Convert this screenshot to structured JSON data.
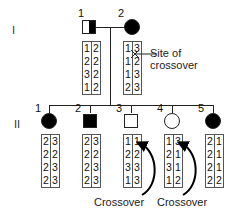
{
  "generations": {
    "I": {
      "label": "I"
    },
    "II": {
      "label": "II"
    }
  },
  "individuals": {
    "I_1": {
      "num": "1",
      "sex": "male",
      "status": "half-affected",
      "haplotypes": [
        [
          "1",
          "2",
          "3",
          "1"
        ],
        [
          "2",
          "2",
          "2",
          "2"
        ]
      ]
    },
    "I_2": {
      "num": "2",
      "sex": "female",
      "status": "affected",
      "haplotypes": [
        [
          "1",
          "1",
          "1",
          "2"
        ],
        [
          "3",
          "2",
          "3",
          "3"
        ]
      ]
    },
    "II_1": {
      "num": "1",
      "sex": "female",
      "status": "affected",
      "haplotypes": [
        [
          "2",
          "2",
          "2",
          "2"
        ],
        [
          "3",
          "2",
          "3",
          "3"
        ]
      ]
    },
    "II_2": {
      "num": "2",
      "sex": "male",
      "status": "affected",
      "haplotypes": [
        [
          "2",
          "2",
          "2",
          "2"
        ],
        [
          "3",
          "2",
          "3",
          "3"
        ]
      ]
    },
    "II_3": {
      "num": "3",
      "sex": "male",
      "status": "unaffected",
      "haplotypes": [
        [
          "1",
          "2",
          "3",
          "1"
        ],
        [
          "1",
          "2",
          "3",
          "3"
        ]
      ]
    },
    "II_4": {
      "num": "4",
      "sex": "female",
      "status": "unaffected",
      "haplotypes": [
        [
          "1",
          "2",
          "3",
          "1"
        ],
        [
          "3",
          "1",
          "1",
          "2"
        ]
      ]
    },
    "II_5": {
      "num": "5",
      "sex": "female",
      "status": "affected",
      "haplotypes": [
        [
          "2",
          "2",
          "2",
          "2"
        ],
        [
          "1",
          "1",
          "1",
          "2"
        ]
      ]
    }
  },
  "annotations": {
    "site_of_crossover": {
      "line1": "Site of",
      "line2": "crossover"
    },
    "crossover_1": "Crossover",
    "crossover_2": "Crossover"
  },
  "colors": {
    "affected": "#000000",
    "unaffected": "#ffffff",
    "line": "#222222"
  }
}
